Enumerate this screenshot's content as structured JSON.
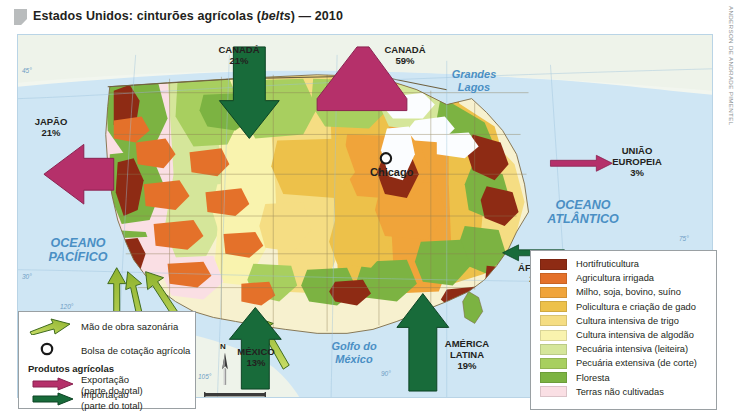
{
  "title": {
    "main_before": "Estados Unidos: cinturões agrícolas (",
    "italic": "belts",
    "main_after": ") — 2010"
  },
  "credit": "ANDERSON DE ANDRADE PIMENTEL",
  "map": {
    "ocean_labels": [
      {
        "name": "oceano-pacifico",
        "text": "OCEANO\nPACÍFICO"
      },
      {
        "name": "oceano-atlantico",
        "text": "OCEANO\nATLÂNTICO"
      },
      {
        "name": "grandes-lagos",
        "text": "Grandes\nLagos"
      },
      {
        "name": "golfo-do-mexico",
        "text": "Golfo do\nMéxico"
      }
    ],
    "pacifico_l1": "OCEANO",
    "pacifico_l2": "PACÍFICO",
    "atlantico_l1": "OCEANO",
    "atlantico_l2": "ATLÂNTICO",
    "lagos_l1": "Grandes",
    "lagos_l2": "Lagos",
    "golfo_l1": "Golfo do",
    "golfo_l2": "México",
    "city": "Chicago",
    "coords": {
      "lat45": "45°",
      "lat30": "30°",
      "lat75": "75°",
      "lon120": "120°",
      "lon105": "105°",
      "lon90": "90°"
    },
    "compass_n": "N",
    "scale": "320 km"
  },
  "flows": [
    {
      "name": "canada-import",
      "country": "CANADÁ",
      "pct": "21%",
      "type": "importacao"
    },
    {
      "name": "canada-export",
      "country": "CANADÁ",
      "pct": "59%",
      "type": "exportacao"
    },
    {
      "name": "japao-export",
      "country": "JAPÃO",
      "pct": "21%",
      "type": "exportacao"
    },
    {
      "name": "uniao-europeia-export",
      "country": "UNIÃO\nEUROPEIA",
      "pct": "3%",
      "type": "exportacao"
    },
    {
      "name": "africa-import",
      "country": "ÁFRICA",
      "pct": "2%",
      "type": "importacao"
    },
    {
      "name": "mexico-import",
      "country": "MÉXICO",
      "pct": "13%",
      "type": "importacao"
    },
    {
      "name": "america-latina-import",
      "country": "AMÉRICA\nLATINA",
      "pct": "19%",
      "type": "importacao"
    }
  ],
  "flow_text": {
    "canada_import_c": "CANADÁ",
    "canada_import_p": "21%",
    "canada_export_c": "CANADÁ",
    "canada_export_p": "59%",
    "japao_c": "JAPÃO",
    "japao_p": "21%",
    "ue_c1": "UNIÃO",
    "ue_c2": "EUROPEIA",
    "ue_p": "3%",
    "africa_c": "ÁFRICA",
    "africa_p": "2%",
    "mexico_c": "MÉXICO",
    "mexico_p": "13%",
    "al_c1": "AMÉRICA",
    "al_c2": "LATINA",
    "al_p": "19%"
  },
  "legend_symbols": {
    "labor": "Mão de obra sazonária",
    "exchange": "Bolsa de cotação agrícola",
    "products_heading": "Produtos agrícolas",
    "export_l1": "Exportação",
    "export_l2": "(parte do total)",
    "import_l1": "Importação",
    "import_l2": "(parte do total)",
    "export_color": "#b5306a",
    "import_color": "#186b3a",
    "labor_color": "#a9c43c"
  },
  "legend_classes": [
    {
      "label": "Hortifruticultura",
      "color": "#8e2b14"
    },
    {
      "label": "Agricultura irrigada",
      "color": "#e4712a"
    },
    {
      "label": "Milho, soja, bovino, suíno",
      "color": "#f0a43a"
    },
    {
      "label": "Policultura e criação de gado",
      "color": "#edc14a"
    },
    {
      "label": "Cultura intensiva de trigo",
      "color": "#f5dd83"
    },
    {
      "label": "Cultura intensiva de algodão",
      "color": "#f9f3ae"
    },
    {
      "label": "Pecuária intensiva (leiteira)",
      "color": "#d5e69a"
    },
    {
      "label": "Pecuária extensiva (de corte)",
      "color": "#a8cf5f"
    },
    {
      "label": "Floresta",
      "color": "#7cb342"
    },
    {
      "label": "Terras não cultivadas",
      "color": "#fadfe4"
    }
  ]
}
